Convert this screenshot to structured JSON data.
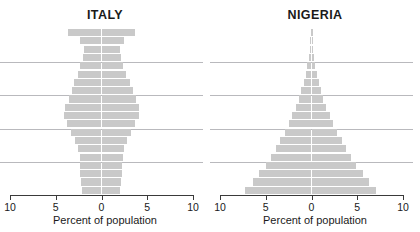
{
  "figure": {
    "background": "#ffffff",
    "bar_color": "#c9c9c9",
    "gridline_color": "#b9b9bd",
    "axis_color": "#3a3a3a"
  },
  "panels": [
    {
      "id": "italy",
      "title": "ITALY",
      "axis_title": "Percent of population",
      "tick_labels": [
        "10",
        "5",
        "0",
        "5",
        "10"
      ],
      "tick_values": [
        -10,
        -5,
        0,
        5,
        10
      ]
    },
    {
      "id": "nigeria",
      "title": "NIGERIA",
      "axis_title": "Percent of population",
      "tick_labels": [
        "10",
        "5",
        "0",
        "5",
        "10"
      ],
      "tick_values": [
        -10,
        -5,
        0,
        5,
        10
      ]
    }
  ],
  "chart_data": [
    {
      "type": "bar",
      "subtype": "population-pyramid",
      "title": "ITALY",
      "xlabel": "Percent of population",
      "ylabel": "",
      "xlim": [
        -10,
        10
      ],
      "xticks": [
        -10,
        -5,
        0,
        5,
        10
      ],
      "xticklabels": [
        "10",
        "5",
        "0",
        "5",
        "10"
      ],
      "grid": true,
      "gridlines_y": [
        4,
        8,
        12,
        16
      ],
      "legend": "none",
      "age_groups": [
        "0-4",
        "5-9",
        "10-14",
        "15-19",
        "20-24",
        "25-29",
        "30-34",
        "35-39",
        "40-44",
        "45-49",
        "50-54",
        "55-59",
        "60-64",
        "65-69",
        "70-74",
        "75-79",
        "80-84",
        "85-89",
        "90-94",
        "95-99"
      ],
      "series": [
        {
          "name": "Male",
          "side": "left",
          "values": [
            2.1,
            2.2,
            2.3,
            2.3,
            2.4,
            2.6,
            2.9,
            3.3,
            3.8,
            4.1,
            4.0,
            3.6,
            3.2,
            3.0,
            2.6,
            2.3,
            2.0,
            1.9,
            2.4,
            3.7
          ]
        },
        {
          "name": "Female",
          "side": "right",
          "values": [
            2.0,
            2.1,
            2.2,
            2.2,
            2.3,
            2.5,
            2.8,
            3.2,
            3.7,
            4.1,
            4.1,
            3.8,
            3.4,
            3.1,
            2.7,
            2.4,
            2.1,
            2.0,
            2.5,
            3.7
          ]
        }
      ]
    },
    {
      "type": "bar",
      "subtype": "population-pyramid",
      "title": "NIGERIA",
      "xlabel": "Percent of population",
      "ylabel": "",
      "xlim": [
        -10,
        10
      ],
      "xticks": [
        -10,
        -5,
        0,
        5,
        10
      ],
      "xticklabels": [
        "10",
        "5",
        "0",
        "5",
        "10"
      ],
      "grid": true,
      "gridlines_y": [
        4,
        8,
        12,
        16
      ],
      "legend": "none",
      "age_groups": [
        "0-4",
        "5-9",
        "10-14",
        "15-19",
        "20-24",
        "25-29",
        "30-34",
        "35-39",
        "40-44",
        "45-49",
        "50-54",
        "55-59",
        "60-64",
        "65-69",
        "70-74",
        "75-79",
        "80-84",
        "85-89",
        "90-94",
        "95-99"
      ],
      "series": [
        {
          "name": "Male",
          "side": "left",
          "values": [
            7.3,
            6.4,
            5.7,
            5.0,
            4.4,
            3.9,
            3.4,
            2.9,
            2.5,
            2.1,
            1.7,
            1.4,
            1.1,
            0.85,
            0.6,
            0.45,
            0.3,
            0.2,
            0.12,
            0.1
          ]
        },
        {
          "name": "Female",
          "side": "right",
          "values": [
            7.1,
            6.3,
            5.6,
            4.9,
            4.3,
            3.8,
            3.3,
            2.8,
            2.4,
            2.0,
            1.6,
            1.3,
            1.0,
            0.8,
            0.55,
            0.4,
            0.28,
            0.18,
            0.1,
            0.1
          ]
        }
      ]
    }
  ]
}
